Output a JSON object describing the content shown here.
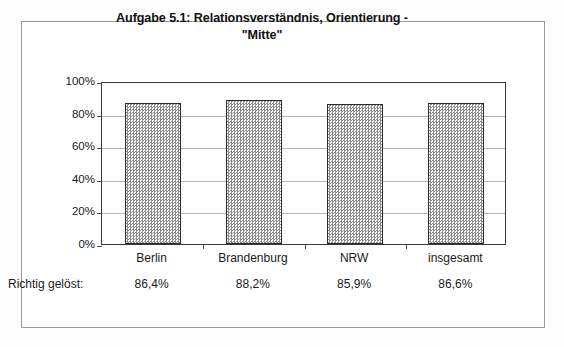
{
  "chart_data": {
    "type": "bar",
    "title": "Aufgabe 5.1: Relationsverständnis, Orientierung - \"Mitte\"",
    "title_line1": "Aufgabe 5.1: Relationsverständnis, Orientierung -",
    "title_line2": "\"Mitte\"",
    "categories": [
      "Berlin",
      "Brandenburg",
      "NRW",
      "insgesamt"
    ],
    "values": [
      86.4,
      88.2,
      85.9,
      86.6
    ],
    "value_labels": [
      "86,4%",
      "88,2%",
      "85,9%",
      "86,6%"
    ],
    "data_row_label": "Richtig gelöst:",
    "xlabel": "",
    "ylabel": "",
    "ylim": [
      0,
      100
    ],
    "ytick_values": [
      100,
      80,
      60,
      40,
      20,
      0
    ],
    "ytick_labels": [
      "100%",
      "80%",
      "60%",
      "40%",
      "20%",
      "0%"
    ],
    "grid": true,
    "legend": false,
    "legend_position": "none",
    "bar_fill": "#8d8d8d",
    "bar_fill_style": "fine-checkerboard-hatch",
    "bar_border_color": "#2c2c2c",
    "gridline_color": "#b5b5b5",
    "axis_color": "#3a3a3a",
    "frame_color": "#9a9a9a",
    "background": "#ffffff"
  }
}
